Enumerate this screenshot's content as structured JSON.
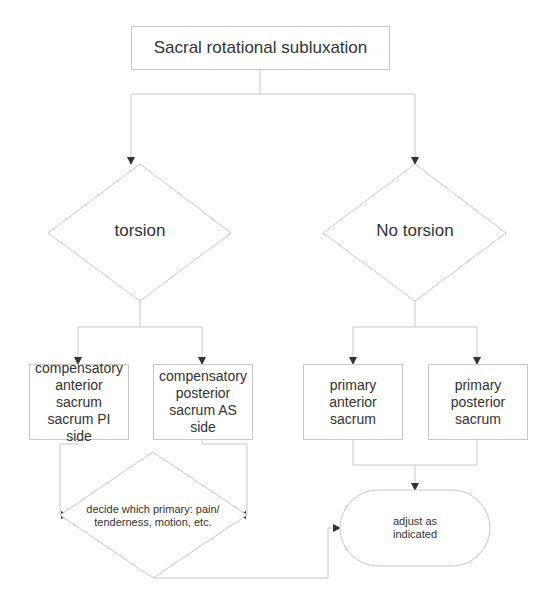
{
  "diagram": {
    "type": "flowchart",
    "title": "Sacral rotational subluxation",
    "decisions": {
      "torsion": "torsion",
      "no_torsion": "No torsion",
      "decide": "decide which primary: pain/ tenderness, motion, etc."
    },
    "boxes": {
      "comp_anterior": "compensatory anterior sacrum sacrum PI side",
      "comp_posterior": "compensatory posterior sacrum AS side",
      "primary_anterior": "primary anterior sacrum",
      "primary_posterior": "primary posterior sacrum"
    },
    "terminal": "adjust as indicated",
    "colors": {
      "stroke": "#c8c8c8",
      "arrow": "#333333",
      "text": "#333333",
      "background": "#ffffff"
    }
  }
}
